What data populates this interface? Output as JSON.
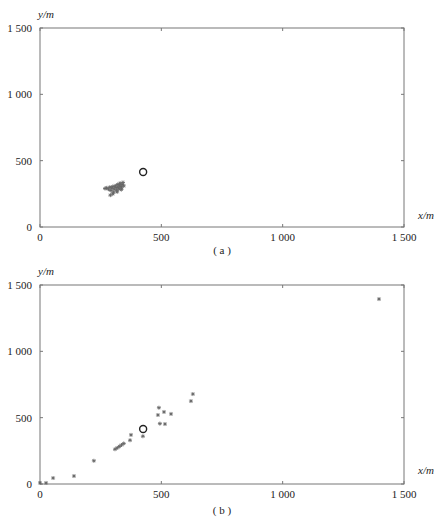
{
  "chart_data": [
    {
      "type": "scatter",
      "panel": "a",
      "caption": "( a )",
      "xlabel": "x/m",
      "ylabel": "y/m",
      "xlim": [
        0,
        1500
      ],
      "ylim": [
        0,
        1500
      ],
      "xticks": [
        0,
        500,
        1000,
        1500
      ],
      "xtick_labels": [
        "0",
        "500",
        "1 000",
        "1 500"
      ],
      "yticks": [
        0,
        500,
        1000,
        1500
      ],
      "ytick_labels": [
        "0",
        "500",
        "1 000",
        "1 500"
      ],
      "grid": false,
      "legend": null,
      "series": [
        {
          "name": "points",
          "marker": "asterisk",
          "points": [
            [
              268,
              290
            ],
            [
              275,
              295
            ],
            [
              282,
              285
            ],
            [
              288,
              300
            ],
            [
              292,
              275
            ],
            [
              296,
              292
            ],
            [
              300,
              305
            ],
            [
              303,
              262
            ],
            [
              306,
              285
            ],
            [
              310,
              310
            ],
            [
              313,
              298
            ],
            [
              316,
              278
            ],
            [
              320,
              320
            ],
            [
              322,
              300
            ],
            [
              325,
              288
            ],
            [
              328,
              315
            ],
            [
              330,
              330
            ],
            [
              333,
              305
            ],
            [
              336,
              295
            ],
            [
              339,
              320
            ],
            [
              342,
              335
            ],
            [
              345,
              310
            ],
            [
              300,
              250
            ],
            [
              318,
              265
            ],
            [
              290,
              240
            ],
            [
              335,
              282
            ]
          ]
        },
        {
          "name": "center",
          "marker": "open-circle",
          "points": [
            [
              425,
              415
            ]
          ]
        }
      ]
    },
    {
      "type": "scatter",
      "panel": "b",
      "caption": "( b )",
      "xlabel": "x/m",
      "ylabel": "y/m",
      "xlim": [
        0,
        1500
      ],
      "ylim": [
        0,
        1500
      ],
      "xticks": [
        0,
        500,
        1000,
        1500
      ],
      "xtick_labels": [
        "0",
        "500",
        "1 000",
        "1 500"
      ],
      "yticks": [
        0,
        500,
        1000,
        1500
      ],
      "ytick_labels": [
        "0",
        "500",
        "1 000",
        "1 500"
      ],
      "grid": false,
      "legend": null,
      "series": [
        {
          "name": "points",
          "marker": "asterisk",
          "points": [
            [
              0,
              8
            ],
            [
              25,
              8
            ],
            [
              54,
              45
            ],
            [
              140,
              60
            ],
            [
              222,
              175
            ],
            [
              309,
              262
            ],
            [
              318,
              272
            ],
            [
              327,
              283
            ],
            [
              336,
              294
            ],
            [
              345,
              305
            ],
            [
              371,
              330
            ],
            [
              375,
              370
            ],
            [
              424,
              360
            ],
            [
              486,
              520
            ],
            [
              490,
              575
            ],
            [
              511,
              543
            ],
            [
              540,
              528
            ],
            [
              494,
              455
            ],
            [
              515,
              452
            ],
            [
              622,
              625
            ],
            [
              630,
              678
            ],
            [
              1397,
              1394
            ]
          ]
        },
        {
          "name": "center",
          "marker": "open-circle",
          "points": [
            [
              425,
              415
            ]
          ]
        }
      ]
    }
  ],
  "panels": [
    {
      "caption": "( a )",
      "xlabel": "x/m",
      "ylabel": "y/m"
    },
    {
      "caption": "( b )",
      "xlabel": "x/m",
      "ylabel": "y/m"
    }
  ]
}
